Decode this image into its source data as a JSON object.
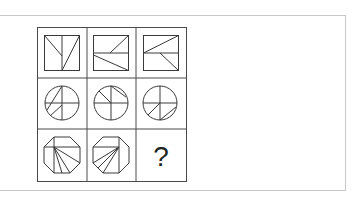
{
  "puzzle": {
    "rows": 3,
    "cols": 3,
    "question_mark": "?",
    "colors": {
      "line": "#3a3a3a",
      "grid": "#4a4a4a",
      "panel_border": "#c8c8c8",
      "background": "#ffffff"
    },
    "cells": [
      {
        "shape": "square",
        "description": "square with vertical center line, diagonal from top-left to center line, diagonal from top-right to bottom of center line"
      },
      {
        "shape": "square",
        "description": "square with horizontal center line, diagonal from center to top-right, diagonal from left to bottom-right"
      },
      {
        "shape": "square",
        "description": "square with horizontal center line, diagonal from left-mid to top-right, diagonal from center to bottom-right"
      },
      {
        "shape": "circle",
        "description": "circle with cross lines and two diagonal chords on left side"
      },
      {
        "shape": "circle",
        "description": "circle with cross lines and two diagonal chords on top"
      },
      {
        "shape": "circle",
        "description": "circle with cross lines and two diagonal chords on bottom"
      },
      {
        "shape": "octagon",
        "description": "octagon with lines fanning from upper-left vertex toward bottom"
      },
      {
        "shape": "octagon",
        "description": "octagon with lines fanning from upper-right vertex toward left-bottom"
      },
      {
        "shape": "unknown",
        "description": "question mark"
      }
    ]
  }
}
